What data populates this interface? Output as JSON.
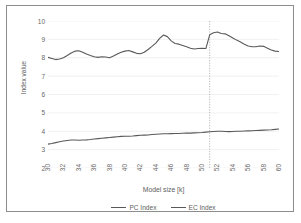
{
  "chart_data": {
    "type": "line",
    "title": "",
    "xlabel": "Model size [k]",
    "ylabel": "Index value",
    "xlim": [
      30,
      60
    ],
    "ylim": [
      2,
      10
    ],
    "xticks": [
      30,
      32,
      34,
      36,
      38,
      40,
      42,
      44,
      46,
      48,
      50,
      52,
      54,
      56,
      58,
      60
    ],
    "yticks": [
      2,
      3,
      4,
      5,
      6,
      7,
      8,
      9,
      10
    ],
    "grid": "horizontal",
    "legend_position": "bottom",
    "annotations": [
      {
        "type": "vertical-dotted-line",
        "x": 51,
        "label": ""
      }
    ],
    "x": [
      30,
      30.5,
      31,
      31.5,
      32,
      32.5,
      33,
      33.5,
      34,
      34.5,
      35,
      35.5,
      36,
      36.5,
      37,
      37.5,
      38,
      38.5,
      39,
      39.5,
      40,
      40.5,
      41,
      41.5,
      42,
      42.5,
      43,
      43.5,
      44,
      44.5,
      45,
      45.5,
      46,
      46.5,
      47,
      47.5,
      48,
      48.5,
      49,
      49.5,
      50,
      50.5,
      51,
      51.5,
      52,
      52.5,
      53,
      53.5,
      54,
      54.5,
      55,
      55.5,
      56,
      56.5,
      57,
      57.5,
      58,
      58.5,
      59,
      59.5,
      60
    ],
    "series": [
      {
        "name": "PC Index",
        "color": "#595959",
        "values": [
          8.02,
          7.96,
          7.9,
          7.93,
          8.0,
          8.12,
          8.26,
          8.36,
          8.38,
          8.3,
          8.2,
          8.12,
          8.05,
          8.02,
          8.05,
          8.04,
          8.0,
          8.09,
          8.2,
          8.3,
          8.36,
          8.39,
          8.32,
          8.24,
          8.22,
          8.3,
          8.45,
          8.62,
          8.8,
          9.05,
          9.24,
          9.15,
          8.92,
          8.78,
          8.74,
          8.67,
          8.6,
          8.52,
          8.48,
          8.5,
          8.52,
          8.5,
          9.25,
          9.36,
          9.4,
          9.32,
          9.3,
          9.2,
          9.08,
          8.96,
          8.86,
          8.74,
          8.64,
          8.6,
          8.6,
          8.64,
          8.62,
          8.52,
          8.42,
          8.36,
          8.34
        ]
      },
      {
        "name": "EC Index",
        "color": "#595959",
        "values": [
          3.3,
          3.33,
          3.38,
          3.43,
          3.47,
          3.5,
          3.52,
          3.52,
          3.51,
          3.52,
          3.53,
          3.55,
          3.58,
          3.6,
          3.62,
          3.64,
          3.66,
          3.68,
          3.7,
          3.72,
          3.73,
          3.73,
          3.74,
          3.76,
          3.78,
          3.79,
          3.8,
          3.82,
          3.84,
          3.85,
          3.86,
          3.86,
          3.87,
          3.88,
          3.88,
          3.89,
          3.9,
          3.9,
          3.91,
          3.92,
          3.93,
          3.95,
          3.97,
          3.99,
          4.0,
          4.0,
          3.99,
          3.98,
          3.99,
          4.0,
          4.0,
          4.01,
          4.02,
          4.03,
          4.04,
          4.05,
          4.06,
          4.07,
          4.08,
          4.1,
          4.12
        ]
      }
    ]
  },
  "legend": {
    "entries": [
      {
        "label": "PC Index"
      },
      {
        "label": "EC Index"
      }
    ]
  }
}
